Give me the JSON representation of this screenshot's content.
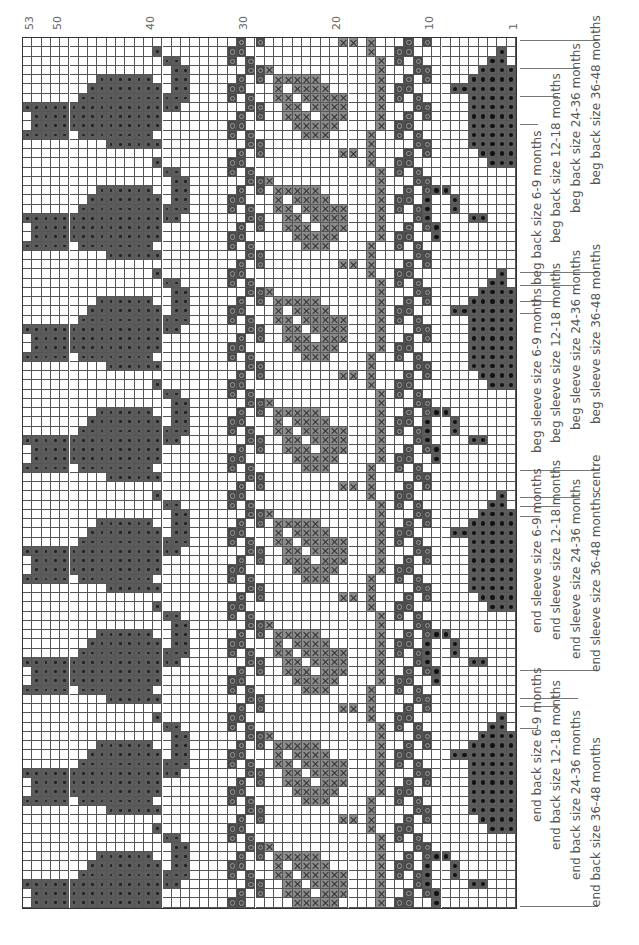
{
  "chart": {
    "columns": 53,
    "rows": 94,
    "cell_w": 9.3,
    "cell_h": 9.25,
    "row_numbers": [
      {
        "label": "53",
        "col": 0
      },
      {
        "label": "50",
        "col": 3
      },
      {
        "label": "40",
        "col": 13
      },
      {
        "label": "30",
        "col": 23
      },
      {
        "label": "20",
        "col": 33
      },
      {
        "label": "10",
        "col": 43
      },
      {
        "label": "1",
        "col": 52
      }
    ],
    "symbols": {
      "D": "contrast colour dot (large teapot)",
      "B": "dark colour bold dot (small teapot)",
      "O": "ring stitch (zigzag band)",
      "X": "cross stitch (grey leaf band)"
    },
    "motifs": {
      "big_teapot": {
        "col": 0,
        "start": 1,
        "repeat": 12,
        "rows": [
          "..............D....",
          "...............DD..",
          "................DD.",
          "........DDDDDD..DD.",
          ".......DDDDDDDD.DD.",
          "......DDDDDDDDDDDD.",
          "DDDDDDDDDDDDDDDDD..",
          ".DDDDDDDDDDDDDD....",
          ".DDDDDDDDDDDDDD....",
          "DDDDD.DDDDDDDD.....",
          ".........DDDDDD....",
          "..................."
        ]
      },
      "zigzag_a": {
        "col": 20,
        "start": 0,
        "repeat": 8,
        "rows": [
          "...O.O",
          "..OO..",
          "..O.O.",
          "....OO",
          "...O.O",
          "..OO..",
          "..O.O.",
          "....OO"
        ]
      },
      "leaf": {
        "col": 26,
        "start": 3,
        "repeat": 12,
        "rows": [
          "X...........",
          ".XXXXX......",
          ".X.XXXX.....",
          ".XX.XXXXX...",
          "..XX.XXXX...",
          "..XXX.XXX...",
          "...XXXXX....",
          "....XXX.....",
          "............",
          "............",
          "............",
          "............"
        ]
      },
      "stem": {
        "col": 34,
        "start": 0,
        "repeat": 12,
        "rows": [
          "XX.X",
          "...X",
          "....X",
          "....X",
          "....X",
          "....X",
          "....X",
          "....X",
          "....X",
          "....X",
          "...X",
          "...X"
        ]
      },
      "zigzag_b": {
        "col": 38,
        "start": 0,
        "repeat": 8,
        "rows": [
          "...O.O",
          "..OO..",
          "..O.O.",
          "....OO",
          "...O.O",
          "..OO..",
          "..O.O.",
          "....OO"
        ]
      },
      "small_teapot": {
        "col": 42,
        "start": 1,
        "repeat": 24,
        "rows": [
          ".........B...",
          "........BB...",
          ".......BBBB.B",
          "......BBBBBB.",
          "....BBBBBBBBB",
          "......BBBBB..",
          "......BBBBB..",
          "......BBBBB..",
          "......BBBBB..",
          "......BBBBB.B",
          "......BBBBBB.",
          ".......BBBB..",
          "........BBB..",
          "............B",
          "............B",
          "..BB........B",
          ".B..B.......B",
          ".B..B.......B",
          ".B....BB.....",
          "..B..........",
          "..B..........",
          ".............",
          ".............",
          "............."
        ]
      }
    }
  },
  "labels": [
    {
      "text": "beg back size 6-9 months",
      "x": 530,
      "y": 285
    },
    {
      "text": "beg back size 12-18 months",
      "x": 549,
      "y": 243
    },
    {
      "text": "beg back size 24-36 months",
      "x": 569,
      "y": 213
    },
    {
      "text": "beg back size 36-48 months",
      "x": 589,
      "y": 185
    },
    {
      "text": "beg sleeve size 6-9 months",
      "x": 530,
      "y": 453
    },
    {
      "text": "beg sleeve size 12-18 months",
      "x": 549,
      "y": 443
    },
    {
      "text": "beg sleeve size 24-36 months",
      "x": 569,
      "y": 430
    },
    {
      "text": "beg sleeve size 36-48 months",
      "x": 589,
      "y": 424
    },
    {
      "text": "centre",
      "x": 589,
      "y": 493
    },
    {
      "text": "end sleeve size 6-9 months",
      "x": 530,
      "y": 633
    },
    {
      "text": "end sleeve size 12-18 months",
      "x": 549,
      "y": 640
    },
    {
      "text": "end sleeve size 24-36 months",
      "x": 569,
      "y": 659
    },
    {
      "text": "end sleeve size 36-48 months",
      "x": 589,
      "y": 672
    },
    {
      "text": "end back size 6-9 months",
      "x": 530,
      "y": 822
    },
    {
      "text": "end back size 12-18 months",
      "x": 549,
      "y": 850
    },
    {
      "text": "end back size 24-36 months",
      "x": 569,
      "y": 880
    },
    {
      "text": "end back size 36-48 months",
      "x": 589,
      "y": 907
    }
  ],
  "ticks": [
    {
      "x": 520,
      "y": 40,
      "w": 78,
      "h": 1
    },
    {
      "x": 520,
      "y": 68,
      "w": 58,
      "h": 1
    },
    {
      "x": 520,
      "y": 96,
      "w": 38,
      "h": 1
    },
    {
      "x": 520,
      "y": 124,
      "w": 18,
      "h": 1
    },
    {
      "x": 520,
      "y": 272,
      "w": 78,
      "h": 1
    },
    {
      "x": 520,
      "y": 285,
      "w": 58,
      "h": 1
    },
    {
      "x": 520,
      "y": 301,
      "w": 38,
      "h": 1
    },
    {
      "x": 520,
      "y": 313,
      "w": 18,
      "h": 1
    },
    {
      "x": 520,
      "y": 470,
      "w": 80,
      "h": 1
    },
    {
      "x": 520,
      "y": 497,
      "w": 60,
      "h": 1
    },
    {
      "x": 520,
      "y": 506,
      "w": 40,
      "h": 1
    },
    {
      "x": 520,
      "y": 516,
      "w": 20,
      "h": 1
    },
    {
      "x": 520,
      "y": 670,
      "w": 78,
      "h": 1
    },
    {
      "x": 520,
      "y": 698,
      "w": 58,
      "h": 1
    },
    {
      "x": 520,
      "y": 706,
      "w": 38,
      "h": 1
    },
    {
      "x": 520,
      "y": 728,
      "w": 18,
      "h": 1
    },
    {
      "x": 520,
      "y": 906,
      "w": 78,
      "h": 1
    }
  ]
}
